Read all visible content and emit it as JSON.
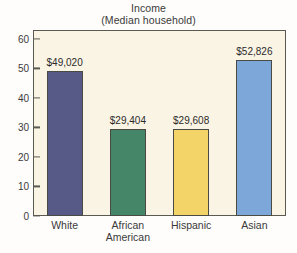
{
  "chart_data": {
    "type": "bar",
    "title": "Income",
    "subtitle": "(Median household)",
    "xlabel": "",
    "ylabel": "",
    "categories": [
      "White",
      "African American",
      "Hispanic",
      "Asian"
    ],
    "category_lines": [
      [
        "White"
      ],
      [
        "African",
        "American"
      ],
      [
        "Hispanic"
      ],
      [
        "Asian"
      ]
    ],
    "values": [
      49.02,
      29.404,
      29.608,
      52.826
    ],
    "value_labels": [
      "$49,020",
      "$29,404",
      "$29,608",
      "$52,826"
    ],
    "bar_colors": [
      "#575a86",
      "#458568",
      "#f2d469",
      "#7da7d9"
    ],
    "ylim": [
      0,
      63
    ],
    "yticks": [
      0,
      10,
      20,
      30,
      40,
      50,
      60
    ],
    "ytick_labels": [
      "0",
      "10",
      "20",
      "30",
      "40",
      "50",
      "60"
    ],
    "grid": false,
    "legend": "none",
    "units": "thousands of dollars",
    "plot_background": "#faf4e4",
    "frame_color": "#5a5a52"
  }
}
